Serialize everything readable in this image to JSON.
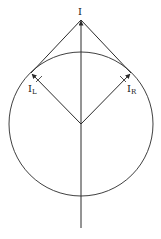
{
  "diagram": {
    "type": "vector-diagram",
    "labels": {
      "top": "I",
      "left_main": "I",
      "left_sub": "L",
      "right_main": "I",
      "right_sub": "R"
    },
    "colors": {
      "stroke": "#2a2a2a",
      "background": "#ffffff"
    },
    "geometry": {
      "circle_center": [
        81,
        124
      ],
      "circle_radius": 72,
      "apex": [
        81,
        20
      ],
      "left_tangent_point": [
        31,
        73
      ],
      "right_tangent_point": [
        131,
        73
      ],
      "axis_bottom": [
        81,
        228
      ]
    }
  }
}
